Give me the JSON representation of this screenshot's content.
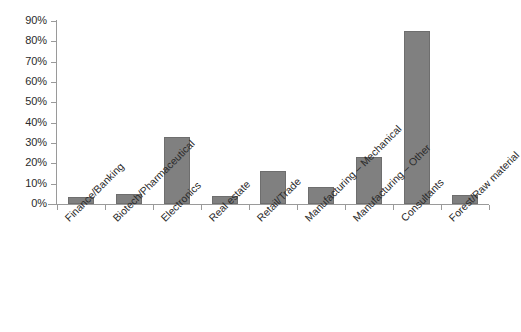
{
  "chart_data": {
    "type": "bar",
    "title": "",
    "subtitle": "",
    "xlabel": "",
    "ylabel": "",
    "ylim": [
      0,
      90
    ],
    "y_tick_labels": [
      "0%",
      "10%",
      "20%",
      "30%",
      "40%",
      "50%",
      "60%",
      "70%",
      "80%",
      "90%"
    ],
    "y_tick_values": [
      0,
      10,
      20,
      30,
      40,
      50,
      60,
      70,
      80,
      90
    ],
    "grid": false,
    "legend": false,
    "legend_position": "none",
    "bar_color": "#808080",
    "bar_border_color": "#6e6e6e",
    "axis_color": "#9a9a9a",
    "categories": [
      "Finance/Banking",
      "Biotech/Pharmaceutical",
      "Electronics",
      "Real estate",
      "Retail/Trade",
      "Manufacturing – Mechanical",
      "Manufacturing – Other",
      "Consultants",
      "Forest/Raw material"
    ],
    "values": [
      3.5,
      5,
      33,
      4,
      16,
      8.5,
      23,
      85,
      4.5
    ],
    "value_unit": "%"
  }
}
